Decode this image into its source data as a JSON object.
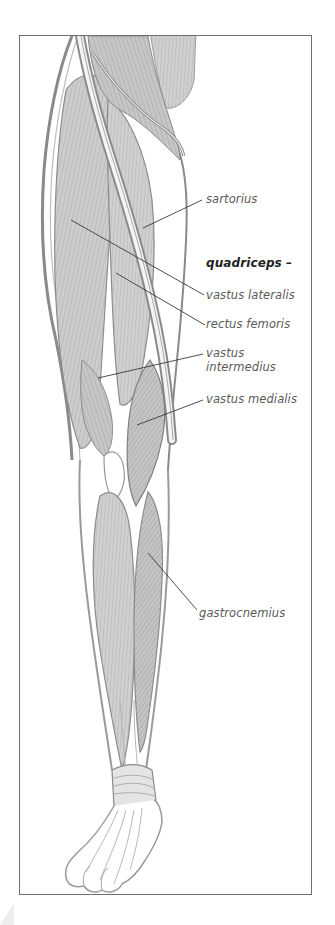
{
  "figure": {
    "colors": {
      "frame": "#6f6f6f",
      "muscle_fill": "#c9c9c9",
      "muscle_stroke": "#8a8a8a",
      "outline": "#9a9a9a",
      "leader": "#3a3a3a",
      "label": "#5a5a5a",
      "group_label": "#222222"
    }
  },
  "labels": [
    {
      "id": "sartorius",
      "text": "sartorius",
      "x": 206,
      "y": 192,
      "group": false,
      "leader": {
        "x1": 143,
        "y1": 228,
        "x2": 202,
        "y2": 200
      }
    },
    {
      "id": "quadriceps",
      "text": "quadriceps –",
      "x": 206,
      "y": 256,
      "group": true,
      "leader": null
    },
    {
      "id": "vastus-lateralis",
      "text": "vastus lateralis",
      "x": 206,
      "y": 288,
      "group": false,
      "leader": {
        "x1": 71,
        "y1": 220,
        "x2": 204,
        "y2": 295
      }
    },
    {
      "id": "rectus-femoris",
      "text": "rectus femoris",
      "x": 206,
      "y": 317,
      "group": false,
      "leader": {
        "x1": 116,
        "y1": 273,
        "x2": 205,
        "y2": 325
      }
    },
    {
      "id": "vastus-intermedius",
      "text": "vastus",
      "text2": "intermedius",
      "x": 206,
      "y": 346,
      "group": false,
      "leader": {
        "x1": 98,
        "y1": 378,
        "x2": 203,
        "y2": 354
      }
    },
    {
      "id": "vastus-medialis",
      "text": "vastus medialis",
      "x": 206,
      "y": 392,
      "group": false,
      "leader": {
        "x1": 137,
        "y1": 425,
        "x2": 203,
        "y2": 400
      }
    },
    {
      "id": "gastrocnemius",
      "text": "gastrocnemius",
      "x": 199,
      "y": 606,
      "group": false,
      "leader": {
        "x1": 148,
        "y1": 553,
        "x2": 197,
        "y2": 610
      }
    }
  ]
}
